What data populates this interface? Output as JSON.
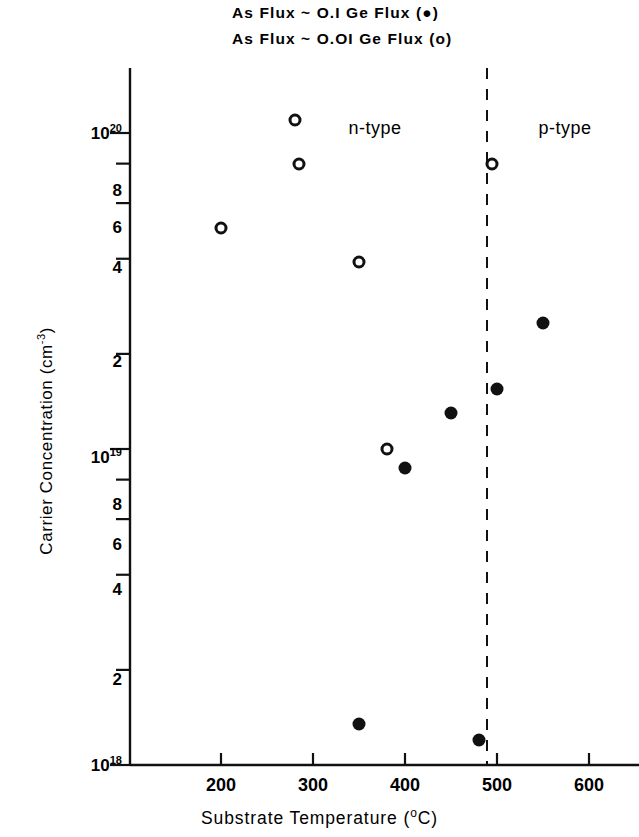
{
  "legend": {
    "entries": [
      {
        "text": "As  Flux ~ O.I  Ge  Flux  (●)",
        "marker": "filled-circle"
      },
      {
        "text": "As  Flux ~ O.OI Ge  Flux  (o)",
        "marker": "open-circle"
      }
    ]
  },
  "chart_data": {
    "type": "scatter",
    "title": "",
    "xlabel": "Substrate  Temperature (°C)",
    "ylabel": "Carrier Concentration (cm⁻³)",
    "xlim": [
      130,
      640
    ],
    "ylim": [
      1e+18,
      3.5e+20
    ],
    "yscale": "log",
    "xscale": "linear",
    "grid": false,
    "legend_position": "above-plot",
    "xticks": [
      200,
      300,
      400,
      500,
      600
    ],
    "xtick_labels": [
      "200",
      "300",
      "400",
      "500",
      "600"
    ],
    "yticks": [
      1e+18,
      2e+18,
      4e+18,
      6e+18,
      8e+18,
      1e+19,
      2e+19,
      4e+19,
      6e+19,
      8e+19,
      1e+20
    ],
    "ytick_labels": [
      "10¹⁸",
      "2",
      "4",
      "6",
      "8",
      "10¹⁹",
      "2",
      "4",
      "6",
      "8",
      "10²⁰"
    ],
    "annotations": [
      {
        "text": "n-type",
        "x": 375,
        "y": 1.05e+20
      },
      {
        "text": "p-type",
        "x": 565,
        "y": 1.05e+20
      },
      {
        "text": "dashed-divider",
        "x": 490,
        "type": "vline"
      }
    ],
    "series": [
      {
        "name": "As Flux ~ O.OI Ge Flux",
        "marker": "open-circle",
        "points": [
          {
            "x": 200,
            "y": 5e+19
          },
          {
            "x": 250,
            "y": 3e+20
          },
          {
            "x": 280,
            "y": 1.1e+20
          },
          {
            "x": 285,
            "y": 8e+19
          },
          {
            "x": 350,
            "y": 3.9e+19
          },
          {
            "x": 380,
            "y": 1e+19
          },
          {
            "x": 495,
            "y": 8e+19
          }
        ]
      },
      {
        "name": "As Flux ~ O.I Ge Flux",
        "marker": "filled-circle",
        "points": [
          {
            "x": 350,
            "y": 1.35e+18
          },
          {
            "x": 400,
            "y": 8.7e+18
          },
          {
            "x": 450,
            "y": 1.3e+19
          },
          {
            "x": 480,
            "y": 1.2e+18
          },
          {
            "x": 500,
            "y": 1.55e+19
          },
          {
            "x": 550,
            "y": 2.5e+19
          }
        ]
      }
    ]
  }
}
